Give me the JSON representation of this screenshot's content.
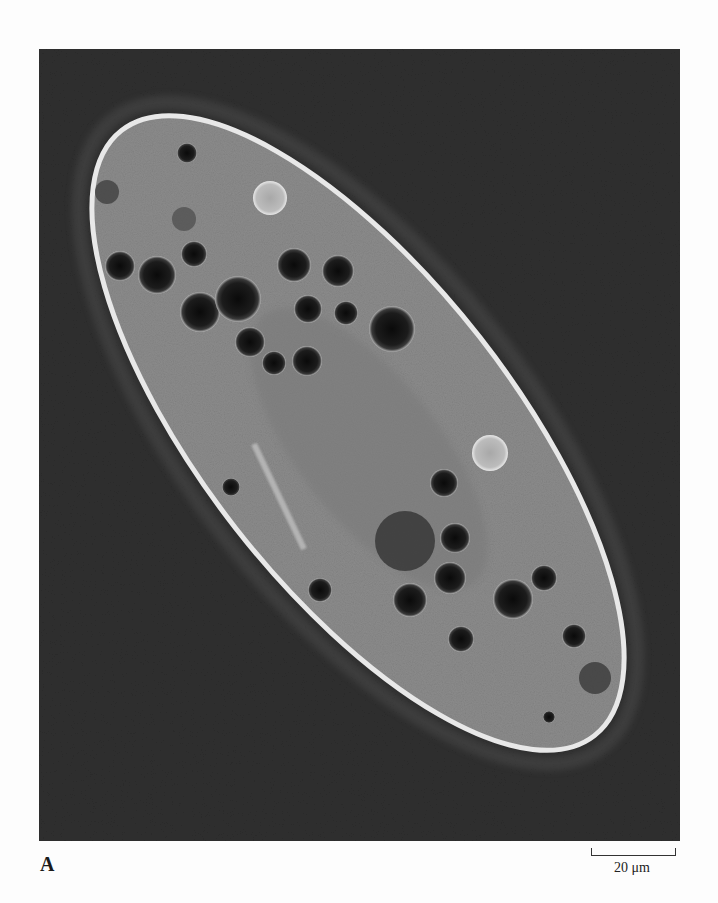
{
  "figure": {
    "panel_label": "A",
    "scale_bar": {
      "label": "20 μm",
      "value": 20,
      "unit": "μm"
    },
    "colors": {
      "background": "#2f2f2f",
      "cell_body": "#8a8a8a",
      "pellicle": "#e6e6e6",
      "vacuole": "#151515",
      "contractile_vacuole": "#bdbdbd",
      "page": "#fdfdfd"
    }
  }
}
